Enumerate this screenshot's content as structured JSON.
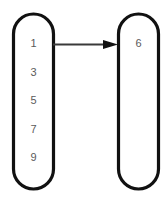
{
  "diagram": {
    "background_color": "#ffffff",
    "outline_color": "#111111",
    "label_color": "#5b5b5b",
    "edge_color": "#3a3a3a",
    "left_capsule": {
      "name": "left-capsule",
      "items": [
        {
          "label": "1"
        },
        {
          "label": "3"
        },
        {
          "label": "5"
        },
        {
          "label": "7"
        },
        {
          "label": "9"
        }
      ]
    },
    "right_capsule": {
      "name": "right-capsule",
      "items": [
        {
          "label": "6"
        }
      ]
    },
    "edge": {
      "name": "arrow-left-to-right",
      "from": "1",
      "to": "6",
      "direction": "right",
      "arrowhead": "filled-triangle"
    }
  }
}
